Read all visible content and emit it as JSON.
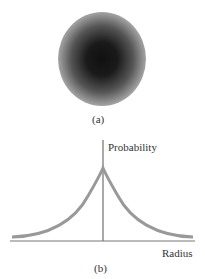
{
  "figure_a": {
    "caption": "(a)",
    "description": "electron probability cloud"
  },
  "figure_b": {
    "caption": "(b)",
    "y_axis_label": "Probability",
    "x_axis_label": "Radius"
  },
  "colors": {
    "curve": "#999999",
    "axis": "#555555"
  }
}
